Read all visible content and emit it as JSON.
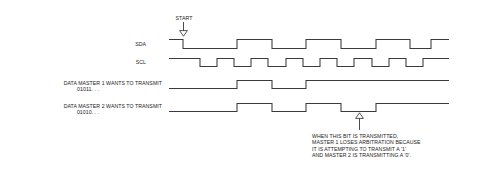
{
  "figure": {
    "background_color": "#ffffff",
    "line_color": "#3a3a3a",
    "text_color": "#1a1a1a"
  },
  "annotations": {
    "start": {
      "label": "START",
      "icon": "down-arrow-marker"
    },
    "arbitration_note": {
      "icon": "up-arrow-marker",
      "line1": "WHEN THIS BIT IS TRANSMITTED,",
      "line2": "MASTER 1 LOSES ARBITRATION BECAUSE",
      "line3": "IT IS ATTEMPTING TO TRANSMIT A '1'",
      "line4": "AND MASTER 2 IS TRANSMITTING A '0'."
    }
  },
  "signals": [
    {
      "name": "sda",
      "label": "SDA",
      "label_line2": "",
      "bits": "x010110",
      "path": "M 169 39.5 L 183 39.5 L 183 48.5 L 237 48.5 L 237 39.5 L 272 39.5 L 272 48.5 L 306 48.5 L 306 39.5 L 341 39.5 L 341 48.5 L 376 48.5 L 376 39.5 L 410 39.5 L 410 48.5 L 431 48.5 L 431 39.5 L 449 39.5"
    },
    {
      "name": "scl",
      "label": "SCL",
      "label_line2": "",
      "bits": "clock",
      "path": "M 169 58.5 L 200 58.5 L 200 66.5 L 217 66.5 L 217 58.5 L 234 58.5 L 234 66.5 L 251 66.5 L 251 58.5 L 268 58.5 L 268 66.5 L 286 66.5 L 286 58.5 L 303 58.5 L 303 66.5 L 320 66.5 L 320 58.5 L 337 58.5 L 337 66.5 L 354 66.5 L 354 58.5 L 372 58.5 L 372 66.5 L 389 66.5 L 389 58.5 L 406 58.5 L 406 66.5 L 423 66.5 L 423 58.5 L 449 58.5"
    },
    {
      "name": "master1-data",
      "label": "DATA MASTER 1 WANTS TO TRANSMIT",
      "label_line2": "01011. . .",
      "bits": "01011",
      "path": "M 169 88.5 L 237 88.5 L 237 80.5 L 272 80.5 L 272 88.5 L 306 88.5 L 306 80.5 L 449 80.5"
    },
    {
      "name": "master2-data",
      "label": "DATA MASTER 2 WANTS TO TRANSMIT",
      "label_line2": "01010. . .",
      "bits": "01010",
      "path": "M 169 111.5 L 237 111.5 L 237 103.5 L 272 103.5 L 272 111.5 L 306 111.5 L 306 103.5 L 341 103.5 L 341 111.5 L 376 111.5 L 376 103.5 L 449 103.5"
    }
  ]
}
